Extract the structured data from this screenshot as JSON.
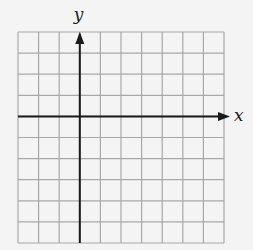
{
  "diagram": {
    "type": "coordinate-grid",
    "grid": {
      "columns": 10,
      "rows": 10,
      "left": 18,
      "top": 32,
      "right": 224,
      "bottom": 243,
      "line_color": "#a8a8a8",
      "background": "#f4f4f4"
    },
    "axes": {
      "x_label": "x",
      "y_label": "y",
      "origin_col": 3,
      "origin_row": 4,
      "axis_color": "#1a1a1a"
    }
  }
}
